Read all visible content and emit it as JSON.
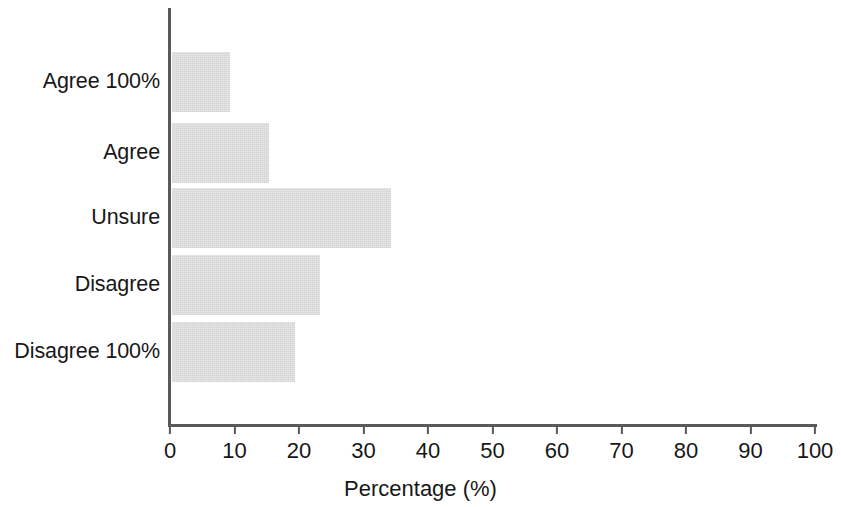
{
  "chart_data": {
    "type": "bar",
    "orientation": "horizontal",
    "title": "",
    "xlabel": "Percentage (%)",
    "ylabel": "",
    "categories": [
      "Agree 100%",
      "Agree",
      "Unsure",
      "Disagree",
      "Disagree 100%"
    ],
    "values": [
      9,
      15,
      34,
      23,
      19
    ],
    "xlim": [
      0,
      100
    ],
    "xticks": [
      0,
      10,
      20,
      30,
      40,
      50,
      60,
      70,
      80,
      90,
      100
    ],
    "xtick_labels": [
      "0",
      "10",
      "20",
      "30",
      "40",
      "50",
      "60",
      "70",
      "80",
      "90",
      "100"
    ],
    "grid": false,
    "legend": null,
    "bar_color": "#e4e4e4",
    "axis_color": "#59595b",
    "text_color": "#171717",
    "background_color": "#ffffff"
  }
}
